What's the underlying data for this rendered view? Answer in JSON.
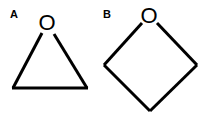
{
  "panels": [
    {
      "label": "A",
      "molecule": "oxirane (three-membered ring)",
      "heteroatom": "O",
      "ring_size": 3
    },
    {
      "label": "B",
      "molecule": "oxetane (four-membered ring)",
      "heteroatom": "O",
      "ring_size": 4
    }
  ],
  "colors": {
    "stroke": "#000000",
    "background": "#ffffff"
  }
}
